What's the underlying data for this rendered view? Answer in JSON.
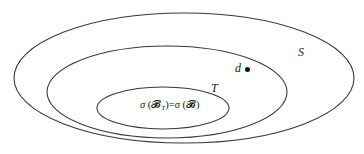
{
  "diagram": {
    "type": "nested-set-diagram",
    "sets": [
      {
        "id": "S",
        "label": "S",
        "role": "outer set",
        "cx": 184,
        "cy": 78,
        "rx": 170,
        "ry": 65
      },
      {
        "id": "T",
        "label": "T",
        "role": "middle set",
        "cx": 167,
        "cy": 92,
        "rx": 120,
        "ry": 46
      },
      {
        "id": "inner",
        "label": "σ (𝓑T)=σ (𝓑)",
        "role": "inner set",
        "cx": 163,
        "cy": 108,
        "rx": 66,
        "ry": 21
      }
    ],
    "labels": {
      "s_label": "S",
      "t_label": "T",
      "point_label": "d",
      "equation": {
        "sigma1": "σ",
        "open1": " (",
        "script_b1": "𝓑",
        "subscript": "T",
        "close1": ")",
        "equals": "=",
        "sigma2": "σ",
        "open2": " (",
        "script_b2": "𝓑",
        "close2": ")"
      }
    },
    "point": {
      "name": "d",
      "x": 247,
      "y": 69
    },
    "colors": {
      "stroke": "#3a3a3a",
      "text": "#222222",
      "background": "#ffffff"
    }
  }
}
